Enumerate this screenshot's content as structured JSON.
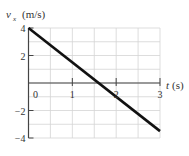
{
  "chart_data": {
    "type": "line",
    "title": "",
    "xlabel": "t (s)",
    "ylabel": "v_x (m/s)",
    "ylabel_main": "v",
    "ylabel_sub": "x",
    "ylabel_unit": "(m/s)",
    "xlabel_var": "t",
    "xlabel_unit": "(s)",
    "xlim": [
      0,
      3
    ],
    "ylim": [
      -4,
      4
    ],
    "x_ticks": [
      "0",
      "1",
      "2",
      "3"
    ],
    "y_ticks": [
      "4",
      "2",
      "-2",
      "-4"
    ],
    "grid": true,
    "grid_x_step": 0.5,
    "grid_y_step": 1,
    "series": [
      {
        "name": "v_x(t)",
        "x": [
          0,
          3
        ],
        "values": [
          4,
          -3.5
        ]
      }
    ],
    "line_color": "#111111",
    "grid_color": "#d4d4d4",
    "axis_color": "#444444"
  }
}
